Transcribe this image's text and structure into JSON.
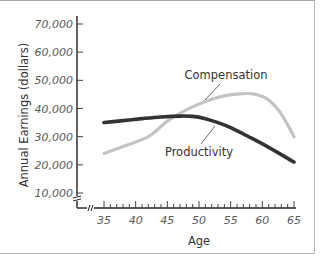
{
  "chart_data": {
    "type": "line",
    "title": "",
    "xlabel": "Age",
    "ylabel": "Annual Earnings (dollars)",
    "xlim": [
      35,
      65
    ],
    "ylim": [
      10000,
      70000
    ],
    "y_axis_break": true,
    "x_axis_break": true,
    "grid": false,
    "x_ticks": [
      35,
      40,
      45,
      50,
      55,
      60,
      65
    ],
    "x_tick_labels": [
      "35",
      "40",
      "45",
      "50",
      "55",
      "60",
      "65"
    ],
    "y_ticks": [
      10000,
      20000,
      30000,
      40000,
      50000,
      60000,
      70000
    ],
    "y_tick_labels": [
      "10,000",
      "20,000",
      "30,000",
      "40,000",
      "50,000",
      "60,000",
      "70,000"
    ],
    "series": [
      {
        "name": "Compensation",
        "color": "#c4c4c4",
        "x": [
          35,
          38,
          42,
          45,
          48,
          51,
          54,
          57,
          59,
          61,
          63,
          65
        ],
        "values": [
          24000,
          26500,
          30000,
          35500,
          39500,
          42500,
          44500,
          45300,
          45000,
          43000,
          38000,
          30000
        ]
      },
      {
        "name": "Productivity",
        "color": "#333333",
        "x": [
          35,
          38,
          41,
          44,
          47,
          49,
          51,
          53,
          55,
          58,
          61,
          65
        ],
        "values": [
          35000,
          35700,
          36400,
          37000,
          37300,
          37200,
          36400,
          35000,
          33200,
          29800,
          26200,
          21000
        ]
      }
    ],
    "annotations": [
      {
        "text": "Compensation",
        "series": "Compensation",
        "pointer_x": 51.5
      },
      {
        "text": "Productivity",
        "series": "Productivity",
        "pointer_x": 52
      }
    ]
  }
}
